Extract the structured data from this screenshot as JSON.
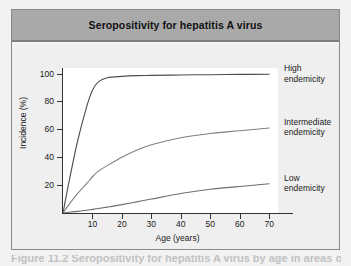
{
  "figure": {
    "title": "Seropositivity for hepatitis A virus",
    "caption": "Figure 11.2 Seropositivity for hepatitis A virus by age in areas of high, intermediate"
  },
  "chart_data": {
    "type": "line",
    "title": "Seropositivity for hepatitis A virus",
    "xlabel": "Age (years)",
    "ylabel": "Incidence (%)",
    "xlim": [
      0,
      73
    ],
    "ylim": [
      0,
      104
    ],
    "xticks": [
      10,
      20,
      30,
      40,
      50,
      60,
      70
    ],
    "yticks": [
      20,
      40,
      60,
      80,
      100
    ],
    "grid": false,
    "legend_position": "right-inline",
    "x": [
      0,
      2,
      5,
      8,
      10,
      12,
      15,
      20,
      25,
      30,
      40,
      50,
      60,
      70
    ],
    "series": [
      {
        "name": "High endemicity",
        "label_line1": "High",
        "label_line2": "endemicity",
        "color": "#4d4d4d",
        "values": [
          0,
          22,
          52,
          76,
          88,
          94,
          97,
          98,
          98.5,
          98.7,
          99,
          99.2,
          99.4,
          99.5
        ]
      },
      {
        "name": "Intermediate endemicity",
        "label_line1": "Intermediate",
        "label_line2": "endemicity",
        "color": "#808080",
        "values": [
          0,
          6,
          14,
          21,
          26,
          30,
          34,
          40,
          45,
          49,
          54,
          57,
          59,
          61
        ]
      },
      {
        "name": "Low endemicity",
        "label_line1": "Low",
        "label_line2": "endemicity",
        "color": "#6e6e6e",
        "values": [
          0,
          0.5,
          1.2,
          2,
          2.6,
          3.2,
          4.2,
          6,
          8,
          10,
          14,
          17,
          19,
          21
        ]
      }
    ]
  },
  "colors": {
    "title_band": "#a9a9a9",
    "chart_bg": "#efefef",
    "plot_bg": "#ffffff",
    "axis": "#333333",
    "page_bg": "#f2f2f2"
  }
}
